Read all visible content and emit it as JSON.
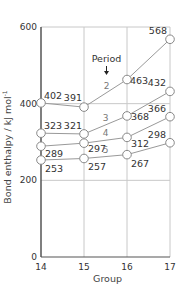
{
  "chart_data": {
    "type": "line",
    "title": "",
    "xlabel": "Group",
    "ylabel": "Bond enthalpy / kJ mol⁻¹",
    "ylabel_main": "Bond enthalpy / kJ mol",
    "ylabel_sup": "-1",
    "x": [
      14,
      15,
      16,
      17
    ],
    "ylim": [
      0,
      600
    ],
    "yticks": [
      0,
      200,
      400,
      600
    ],
    "grid": true,
    "annotation": "Period",
    "series": [
      {
        "name": "2",
        "values": [
          402,
          391,
          463,
          568
        ]
      },
      {
        "name": "3",
        "values": [
          323,
          321,
          368,
          432
        ]
      },
      {
        "name": "4",
        "values": [
          289,
          297,
          312,
          366
        ]
      },
      {
        "name": "5",
        "values": [
          253,
          257,
          267,
          298
        ]
      }
    ]
  },
  "colors": {
    "line": "#999999",
    "grid": "#c8c8c8",
    "axis": "#555555",
    "marker_fill": "#ffffff"
  }
}
